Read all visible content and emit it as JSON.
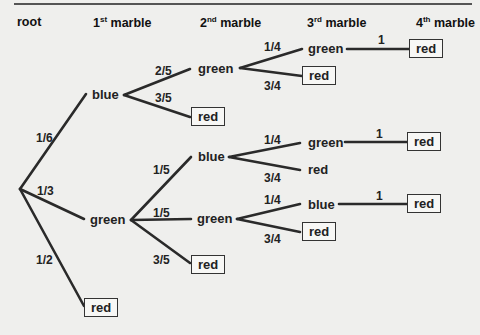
{
  "headers": {
    "root": "root",
    "m1": "1",
    "m1_sup": "st",
    "m1_suffix": " marble",
    "m2": "2",
    "m2_sup": "nd",
    "m2_suffix": " marble",
    "m3": "3",
    "m3_sup": "rd",
    "m3_suffix": " marble",
    "m4": "4",
    "m4_sup": "th",
    "m4_suffix": " marble"
  },
  "nodes": {
    "n1_blue": "blue",
    "n1_green": "green",
    "n1_red": "red",
    "n2_blue_green": "green",
    "n2_blue_red": "red",
    "n2_green_blue": "blue",
    "n2_green_green": "green",
    "n2_green_red": "red",
    "n3_bg_green": "green",
    "n3_bg_red": "red",
    "n3_gb_green": "green",
    "n3_gb_red": "red",
    "n3_gg_blue": "blue",
    "n3_gg_red": "red",
    "n4_bgg_red": "red",
    "n4_gbg_red": "red",
    "n4_ggb_red": "red"
  },
  "probs": {
    "p_blue": "1/6",
    "p_green": "1/3",
    "p_red": "1/2",
    "p_bg": "2/5",
    "p_br": "3/5",
    "p_gb": "1/5",
    "p_gg": "1/5",
    "p_gr": "3/5",
    "p_bgg": "1/4",
    "p_bgr": "3/4",
    "p_gbg": "1/4",
    "p_gbr": "3/4",
    "p_ggb": "1/4",
    "p_ggr": "3/4",
    "p_bggr": "1",
    "p_gbgr": "1",
    "p_ggbr": "1"
  }
}
